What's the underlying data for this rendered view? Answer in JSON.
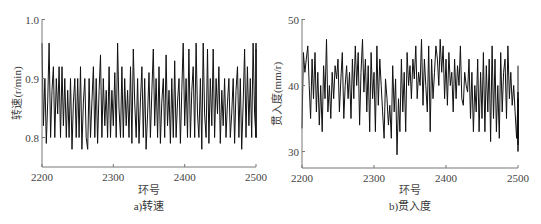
{
  "chart_data": [
    {
      "type": "line",
      "title": "",
      "caption": "a)转速",
      "xlabel": "环号",
      "ylabel": "转速(r/min)",
      "xlim": [
        2200,
        2500
      ],
      "ylim": [
        0.75,
        1.0
      ],
      "xticks": [
        "2200",
        "2300",
        "2400",
        "2500"
      ],
      "yticks": [
        "0.8",
        "0.9",
        "1.0"
      ],
      "grid": false,
      "legend": null,
      "series": [
        {
          "name": "转速",
          "color": "#111111",
          "x_start": 2200,
          "x_step": 2,
          "values": [
            0.96,
            0.82,
            0.9,
            0.79,
            0.86,
            0.96,
            0.8,
            0.88,
            0.92,
            0.8,
            0.9,
            0.84,
            0.92,
            0.8,
            0.92,
            0.82,
            0.9,
            0.8,
            0.88,
            0.8,
            0.9,
            0.78,
            0.86,
            0.9,
            0.8,
            0.9,
            0.8,
            0.92,
            0.78,
            0.86,
            0.9,
            0.8,
            0.78,
            0.9,
            0.8,
            0.86,
            0.92,
            0.8,
            0.9,
            0.79,
            0.88,
            0.94,
            0.8,
            0.9,
            0.82,
            0.88,
            0.8,
            0.92,
            0.8,
            0.88,
            0.82,
            0.91,
            0.8,
            0.96,
            0.85,
            0.8,
            0.92,
            0.8,
            0.9,
            0.82,
            0.88,
            0.8,
            0.92,
            0.79,
            0.95,
            0.86,
            0.8,
            0.9,
            0.79,
            0.86,
            0.92,
            0.8,
            0.9,
            0.78,
            0.84,
            0.91,
            0.8,
            0.88,
            0.95,
            0.82,
            0.9,
            0.8,
            0.92,
            0.79,
            0.86,
            0.9,
            0.8,
            0.94,
            0.82,
            0.88,
            0.79,
            0.9,
            0.8,
            0.93,
            0.8,
            0.86,
            0.9,
            0.79,
            0.88,
            0.96,
            0.82,
            0.9,
            0.8,
            0.95,
            0.8,
            0.88,
            0.92,
            0.8,
            0.96,
            0.84,
            0.8,
            0.9,
            0.78,
            0.96,
            0.84,
            0.8,
            0.95,
            0.79,
            0.9,
            0.82,
            0.95,
            0.8,
            0.9,
            0.84,
            0.92,
            0.79,
            0.88,
            0.82,
            0.9,
            0.8,
            0.86,
            0.9,
            0.8,
            0.84,
            0.9,
            0.79,
            0.88,
            0.92,
            0.8,
            0.9,
            0.78,
            0.86,
            0.95,
            0.8,
            0.92,
            0.82,
            0.9,
            0.8,
            0.96,
            0.84,
            0.8,
            0.96,
            0.8,
            0.88,
            0.95
          ]
        }
      ]
    },
    {
      "type": "line",
      "title": "",
      "caption": "b)贯入度",
      "xlabel": "环号",
      "ylabel": "贯入度(mm/r)",
      "xlim": [
        2200,
        2500
      ],
      "ylim": [
        27.5,
        50
      ],
      "xticks": [
        "2200",
        "2300",
        "2400",
        "2500"
      ],
      "yticks": [
        "30",
        "40",
        "50"
      ],
      "grid": false,
      "legend": null,
      "series": [
        {
          "name": "贯入度",
          "color": "#111111",
          "x_start": 2200,
          "x_step": 2,
          "values": [
            33.5,
            45,
            42,
            44,
            46,
            40,
            35,
            44,
            38,
            45,
            36,
            42,
            34,
            40,
            33,
            43,
            38,
            47,
            36,
            40,
            35,
            42,
            38,
            43,
            41,
            44,
            36,
            41,
            45,
            35,
            40,
            43,
            38,
            42,
            35,
            44,
            38,
            46,
            40,
            45,
            34,
            42,
            47,
            39,
            44,
            36,
            43,
            33,
            45,
            38,
            42,
            33,
            46,
            37,
            44,
            40,
            36,
            32,
            41,
            38,
            34,
            37,
            32,
            43,
            36,
            41,
            29.5,
            38,
            33,
            44,
            36,
            42,
            33,
            45,
            40,
            43,
            38,
            44,
            41,
            46,
            38,
            42,
            40,
            47,
            37,
            44,
            40,
            36,
            46,
            33,
            44,
            38,
            42,
            46,
            44,
            40,
            47,
            42,
            46,
            38,
            44,
            37,
            45,
            40,
            42,
            36,
            44,
            38,
            43,
            40,
            46,
            38,
            37,
            42,
            40,
            39,
            44,
            35,
            42,
            33,
            40,
            36,
            44,
            33,
            42,
            35,
            45,
            33,
            43,
            36,
            44,
            31.5,
            46,
            35,
            44,
            33,
            40,
            32,
            45,
            36,
            42,
            44,
            35,
            46,
            38,
            42,
            37,
            40,
            36,
            32,
            38,
            34,
            37,
            32,
            39,
            31,
            36,
            33,
            38,
            30,
            37,
            32,
            43
          ]
        }
      ]
    }
  ]
}
